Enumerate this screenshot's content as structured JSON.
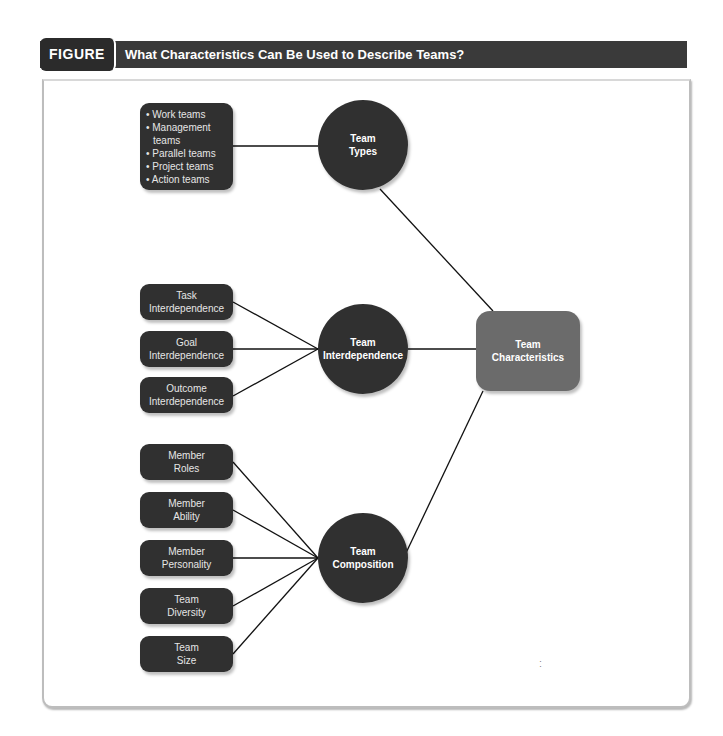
{
  "figure": {
    "label": "FIGURE 11-5",
    "title": "What Characteristics Can Be Used to Describe Teams?"
  },
  "center": {
    "line1": "Team",
    "line2": "Characteristics"
  },
  "groups": [
    {
      "circle": {
        "line1": "Team",
        "line2": "Types"
      },
      "list_items": [
        "• Work teams",
        "• Management",
        "  teams",
        "• Parallel teams",
        "• Project teams",
        "• Action teams"
      ]
    },
    {
      "circle": {
        "line1": "Team",
        "line2": "Interdependence"
      },
      "boxes": [
        {
          "line1": "Task",
          "line2": "Interdependence"
        },
        {
          "line1": "Goal",
          "line2": "Interdependence"
        },
        {
          "line1": "Outcome",
          "line2": "Interdependence"
        }
      ]
    },
    {
      "circle": {
        "line1": "Team",
        "line2": "Composition"
      },
      "boxes": [
        {
          "line1": "Member",
          "line2": "Roles"
        },
        {
          "line1": "Member",
          "line2": "Ability"
        },
        {
          "line1": "Member",
          "line2": "Personality"
        },
        {
          "line1": "Team",
          "line2": "Diversity"
        },
        {
          "line1": "Team",
          "line2": "Size"
        }
      ]
    }
  ],
  "colors": {
    "node_dark": "#303030",
    "center_node": "#6b6b6b",
    "header_bar": "#3a3a3a"
  }
}
